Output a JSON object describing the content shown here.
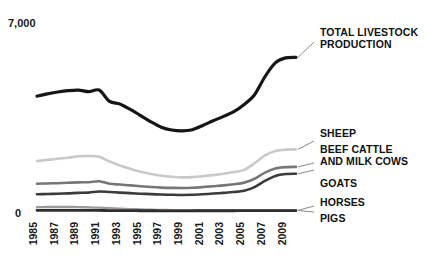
{
  "chart_data": {
    "type": "line",
    "title": "",
    "subtitle": "",
    "xlabel": "",
    "ylabel": "",
    "grid": false,
    "legend_position": "right-inline-labels",
    "ylim": [
      0,
      7000
    ],
    "yticks": [
      0,
      7000
    ],
    "ytick_labels": [
      "0",
      "7,000"
    ],
    "x": [
      1985,
      1986,
      1987,
      1988,
      1989,
      1990,
      1991,
      1992,
      1993,
      1994,
      1995,
      1996,
      1997,
      1998,
      1999,
      2000,
      2001,
      2002,
      2003,
      2004,
      2005,
      2006,
      2007,
      2008,
      2009,
      2010
    ],
    "xtick_labels": [
      "1985",
      "1987",
      "1989",
      "1991",
      "1993",
      "1995",
      "1997",
      "1999",
      "2001",
      "2003",
      "2005",
      "2007",
      "2009"
    ],
    "xticks": [
      1985,
      1987,
      1989,
      1991,
      1993,
      1995,
      1997,
      1999,
      2001,
      2003,
      2005,
      2007,
      2009
    ],
    "series": [
      {
        "name": "TOTAL LIVESTOCK PRODUCTION",
        "label_lines": [
          "TOTAL LIVESTOCK",
          "PRODUCTION"
        ],
        "color": "#161616",
        "width": 3.2,
        "values": [
          4180,
          4260,
          4330,
          4380,
          4400,
          4340,
          4400,
          3990,
          3900,
          3700,
          3480,
          3250,
          3060,
          2960,
          2930,
          2970,
          3120,
          3290,
          3450,
          3620,
          3880,
          4230,
          4880,
          5380,
          5560,
          5580
        ]
      },
      {
        "name": "SHEEP",
        "label_lines": [
          "SHEEP"
        ],
        "color": "#c9c9c9",
        "width": 2.6,
        "values": [
          1840,
          1880,
          1920,
          1960,
          2010,
          2020,
          1990,
          1820,
          1680,
          1560,
          1450,
          1370,
          1310,
          1270,
          1250,
          1260,
          1290,
          1330,
          1380,
          1440,
          1520,
          1760,
          2040,
          2200,
          2250,
          2260
        ]
      },
      {
        "name": "BEEF CATTLE AND MILK COWS",
        "label_lines": [
          "BEEF CATTLE",
          "AND MILK COWS"
        ],
        "color": "#767676",
        "width": 2.6,
        "values": [
          1020,
          1030,
          1040,
          1055,
          1070,
          1075,
          1110,
          1020,
          990,
          960,
          930,
          900,
          880,
          870,
          865,
          875,
          900,
          930,
          960,
          1000,
          1060,
          1200,
          1420,
          1570,
          1620,
          1630
        ]
      },
      {
        "name": "GOATS",
        "label_lines": [
          "GOATS"
        ],
        "color": "#3b3b3b",
        "width": 2.6,
        "values": [
          640,
          650,
          660,
          672,
          690,
          700,
          740,
          720,
          700,
          680,
          660,
          645,
          630,
          620,
          615,
          620,
          640,
          665,
          690,
          720,
          770,
          900,
          1120,
          1300,
          1370,
          1380
        ]
      },
      {
        "name": "HORSES",
        "label_lines": [
          "HORSES"
        ],
        "color": "#9a9a9a",
        "width": 2.4,
        "values": [
          175,
          178,
          180,
          180,
          175,
          168,
          158,
          140,
          122,
          105,
          92,
          82,
          74,
          68,
          64,
          62,
          60,
          58,
          57,
          56,
          56,
          56,
          57,
          58,
          58,
          58
        ]
      },
      {
        "name": "PIGS",
        "label_lines": [
          "PIGS"
        ],
        "color": "#2e2e2e",
        "width": 2.8,
        "values": [
          60,
          60,
          60,
          60,
          60,
          58,
          56,
          52,
          50,
          48,
          46,
          45,
          44,
          44,
          44,
          44,
          45,
          45,
          46,
          46,
          47,
          48,
          50,
          52,
          53,
          53
        ]
      }
    ]
  },
  "axis": {
    "ytop_label": "7,000",
    "ybottom_label": "0"
  }
}
